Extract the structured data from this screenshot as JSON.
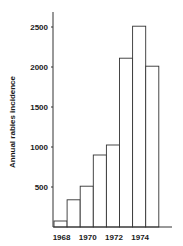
{
  "chart_data": {
    "type": "bar",
    "title": "",
    "xlabel": "",
    "ylabel": "Annual rabies incidence",
    "categories": [
      "1968",
      "1969",
      "1970",
      "1971",
      "1972",
      "1973",
      "1974",
      "1975"
    ],
    "values": [
      75,
      340,
      510,
      900,
      1025,
      2110,
      2510,
      2010
    ],
    "x_tick_labels": [
      "1968",
      "1970",
      "1972",
      "1974"
    ],
    "y_ticks": [
      500,
      1000,
      1500,
      2000,
      2500
    ],
    "ylim": [
      0,
      2700
    ],
    "grid": false,
    "legend": null,
    "bar_style": "outlined histogram, no fill",
    "colors": {
      "stroke": "#333333",
      "fill": "#ffffff",
      "text": "#1a1a1a"
    }
  }
}
